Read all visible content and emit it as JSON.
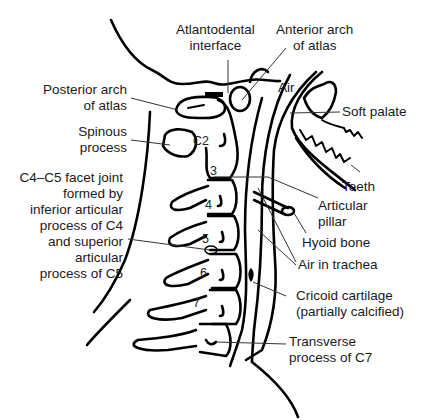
{
  "figure": {
    "colors": {
      "stroke": "#000000",
      "leader": "#333333",
      "text": "#1a1a1a",
      "background": "#ffffff"
    }
  },
  "labels": {
    "atlantodental_interface": {
      "line1": "Atlantodental",
      "line2": "interface"
    },
    "anterior_arch_atlas": {
      "line1": "Anterior arch",
      "line2": "of atlas"
    },
    "posterior_arch_atlas": {
      "line1": "Posterior arch",
      "line2": "of atlas"
    },
    "air": "Air",
    "soft_palate": "Soft palate",
    "spinous_process": {
      "line1": "Spinous",
      "line2": "process"
    },
    "facet_joint": {
      "line1": "C4–C5 facet joint",
      "line2": "formed by",
      "line3": "inferior articular",
      "line4": "process of C4",
      "line5": "and superior",
      "line6": "articular",
      "line7": "process of C5"
    },
    "teeth": "Teeth",
    "articular_pillar": {
      "line1": "Articular",
      "line2": "pillar"
    },
    "hyoid_bone": "Hyoid bone",
    "air_in_trachea": "Air in trachea",
    "cricoid_cartilage": {
      "line1": "Cricoid cartilage",
      "line2": "(partially calcified)"
    },
    "transverse_process_c7": {
      "line1": "Transverse",
      "line2": "process of C7"
    }
  },
  "vertebra_numbers": [
    "C2",
    "3",
    "4",
    "5",
    "6",
    "7"
  ]
}
